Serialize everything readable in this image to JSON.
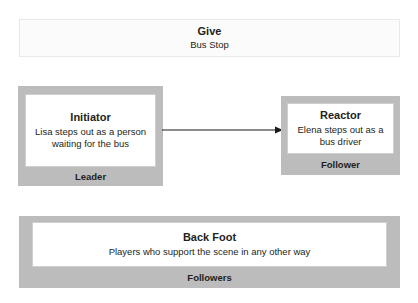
{
  "diagram": {
    "give": {
      "title": "Give",
      "description": "Bus Stop"
    },
    "initiator": {
      "title": "Initiator",
      "description": "Lisa steps out as a person waiting for the bus",
      "role": "Leader"
    },
    "reactor": {
      "title": "Reactor",
      "description": "Elena steps out as a bus driver",
      "role": "Follower"
    },
    "back_foot": {
      "title": "Back Foot",
      "description": "Players who support the scene in any other way",
      "role": "Followers"
    },
    "connector": {
      "from": "Initiator",
      "to": "Reactor",
      "direction": "right"
    },
    "colors": {
      "frame_gray": "#bcbcbc",
      "banner_fill": "#fbfbfb",
      "banner_border": "#e9e9e9",
      "inner_border": "#cfcfcf",
      "text": "#231f20",
      "arrow": "#1a1a1a",
      "background": "#ffffff"
    }
  }
}
